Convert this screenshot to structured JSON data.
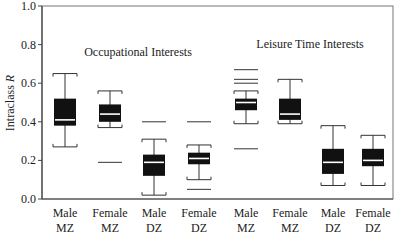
{
  "chart_data": {
    "type": "box",
    "title": "",
    "xlabel": "",
    "ylabel": "Intraclass R",
    "ylim": [
      0.0,
      1.0
    ],
    "yticks": [
      "0.0",
      "0.2",
      "0.4",
      "0.6",
      "0.8",
      "1.0"
    ],
    "grid": false,
    "annotations": [
      {
        "text": "Occupational Interests",
        "group": "occupational"
      },
      {
        "text": "Leisure Time Interests",
        "group": "leisure"
      }
    ],
    "categories": [
      {
        "line1": "Male",
        "line2": "MZ"
      },
      {
        "line1": "Female",
        "line2": "MZ"
      },
      {
        "line1": "Male",
        "line2": "DZ"
      },
      {
        "line1": "Female",
        "line2": "DZ"
      },
      {
        "line1": "Male",
        "line2": "MZ"
      },
      {
        "line1": "Female",
        "line2": "MZ"
      },
      {
        "line1": "Male",
        "line2": "DZ"
      },
      {
        "line1": "Female",
        "line2": "DZ"
      }
    ],
    "series": [
      {
        "name": "Occupational Interests - Male MZ",
        "whisker_low": 0.27,
        "q1": 0.38,
        "median": 0.41,
        "q3": 0.52,
        "whisker_high": 0.65,
        "outliers": []
      },
      {
        "name": "Occupational Interests - Female MZ",
        "whisker_low": 0.37,
        "q1": 0.4,
        "median": 0.44,
        "q3": 0.49,
        "whisker_high": 0.56,
        "outliers": [
          0.19
        ]
      },
      {
        "name": "Occupational Interests - Male DZ",
        "whisker_low": 0.02,
        "q1": 0.12,
        "median": 0.19,
        "q3": 0.23,
        "whisker_high": 0.31,
        "outliers": [
          0.4
        ]
      },
      {
        "name": "Occupational Interests - Female DZ",
        "whisker_low": 0.1,
        "q1": 0.18,
        "median": 0.21,
        "q3": 0.24,
        "whisker_high": 0.28,
        "outliers": [
          0.4,
          0.05
        ]
      },
      {
        "name": "Leisure Time Interests - Male MZ",
        "whisker_low": 0.39,
        "q1": 0.46,
        "median": 0.5,
        "q3": 0.52,
        "whisker_high": 0.56,
        "outliers": [
          0.67,
          0.62,
          0.6,
          0.26
        ]
      },
      {
        "name": "Leisure Time Interests - Female MZ",
        "whisker_low": 0.39,
        "q1": 0.41,
        "median": 0.44,
        "q3": 0.52,
        "whisker_high": 0.62,
        "outliers": []
      },
      {
        "name": "Leisure Time Interests - Male DZ",
        "whisker_low": 0.07,
        "q1": 0.13,
        "median": 0.19,
        "q3": 0.26,
        "whisker_high": 0.38,
        "outliers": []
      },
      {
        "name": "Leisure Time Interests - Female DZ",
        "whisker_low": 0.07,
        "q1": 0.17,
        "median": 0.2,
        "q3": 0.26,
        "whisker_high": 0.33,
        "outliers": []
      }
    ],
    "colors": {
      "box": "#111111",
      "median": "#ffffff",
      "axis": "#444444"
    }
  }
}
